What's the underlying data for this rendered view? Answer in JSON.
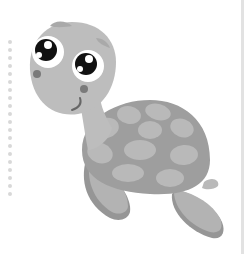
{
  "illustration": {
    "subject": "cartoon sea turtle",
    "style": "grayscale",
    "colors": {
      "background": "#ffffff",
      "body": "#bdbdbd",
      "body_shadow": "#a9a9a9",
      "shell_base": "#9e9e9e",
      "shell_plate": "#b9b9b9",
      "flipper": "#b3b3b3",
      "flipper_shadow": "#969696",
      "eye_white": "#ffffff",
      "pupil": "#111111",
      "cheek": "#7a7a7a",
      "dots": "#d8d8d8",
      "right_bar": "#e2e2e2"
    }
  },
  "decorations": {
    "dotted_line_count": 20,
    "right_border": true
  }
}
